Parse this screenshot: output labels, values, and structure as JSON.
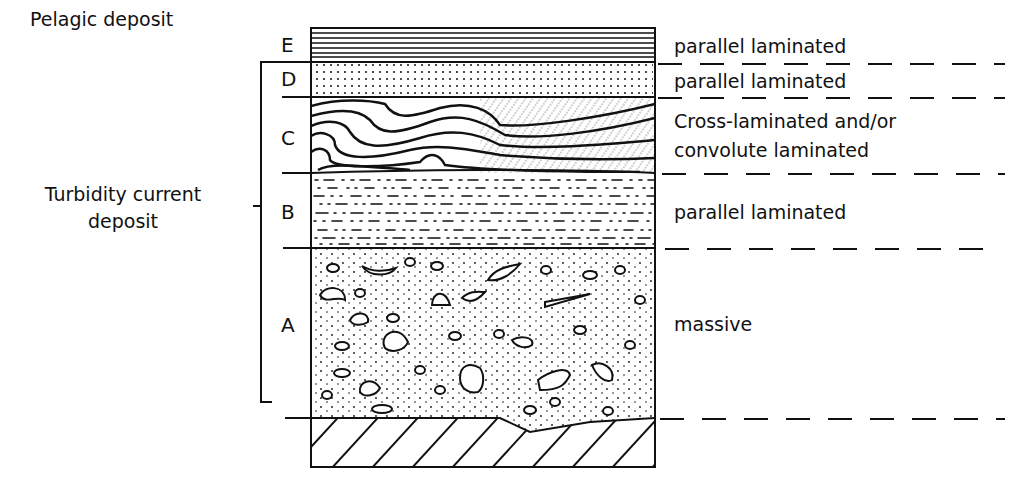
{
  "diagram": {
    "type": "stratigraphic column (Bouma sequence)",
    "groups": {
      "pelagic": "Pelagic deposit",
      "turbidity_line1": "Turbidity current",
      "turbidity_line2": "deposit"
    },
    "units": [
      {
        "letter": "E",
        "description": "parallel laminated",
        "pattern": "horizontal-lines"
      },
      {
        "letter": "D",
        "description": "parallel laminated",
        "pattern": "dots"
      },
      {
        "letter": "C",
        "description_line1": "Cross-laminated and/or",
        "description_line2": "convolute laminated",
        "pattern": "convolute-and-cross-lamination"
      },
      {
        "letter": "B",
        "description": "parallel laminated",
        "pattern": "dashes-and-dots"
      },
      {
        "letter": "A",
        "description": "massive",
        "pattern": "pebbles-and-dots"
      },
      {
        "letter": "",
        "description": "",
        "pattern": "diagonal-hatch (substrate)"
      }
    ],
    "colors": {
      "ink": "#111111",
      "background": "#ffffff"
    }
  }
}
